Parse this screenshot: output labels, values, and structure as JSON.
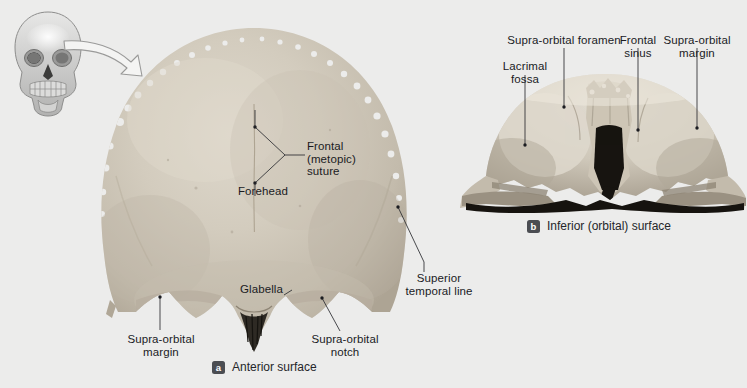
{
  "figure": {
    "background_color": "#ececeb",
    "bone_color": "#cfc8bb",
    "leader_color": "#2b2c30"
  },
  "orientation_icon": {
    "name": "anterior-skull-orientation-diagram",
    "arrow": "curved-pointer-arrow"
  },
  "panel_a": {
    "caption_letter": "a",
    "caption_text": "Anterior surface",
    "labels": [
      {
        "text": "Frontal\n(metopic)\nsuture",
        "align": "left"
      },
      {
        "text": "Forehead",
        "align": "center"
      },
      {
        "text": "Glabella",
        "align": "left"
      },
      {
        "text": "Supra-orbital\nmargin",
        "align": "center"
      },
      {
        "text": "Supra-orbital\nnotch",
        "align": "center"
      },
      {
        "text": "Superior\ntemporal line",
        "align": "center"
      }
    ]
  },
  "panel_b": {
    "caption_letter": "b",
    "caption_text": "Inferior (orbital) surface",
    "labels": [
      {
        "text": "Supra-orbital foramen",
        "align": "center"
      },
      {
        "text": "Lacrimal\nfossa",
        "align": "center"
      },
      {
        "text": "Frontal\nsinus",
        "align": "center"
      },
      {
        "text": "Supra-orbital\nmargin",
        "align": "center"
      }
    ]
  }
}
